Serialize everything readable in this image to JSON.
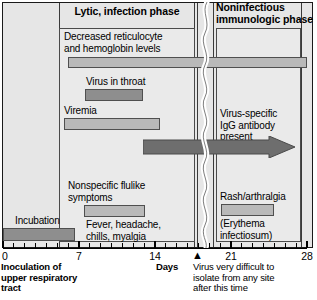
{
  "figure": {
    "axis": {
      "label": "Days",
      "min": 0,
      "max": 28,
      "tick_labels": [
        "0",
        "7",
        "14",
        "21",
        "28"
      ],
      "tick_values": [
        0,
        7,
        14,
        21,
        28
      ],
      "minor_tick_step": 1
    },
    "phases": [
      {
        "id": "lytic",
        "label": "Lytic, infection phase",
        "start_day": 0,
        "end_day": 17
      },
      {
        "id": "immunologic",
        "label": "Noninfectious\nimmunologic phase",
        "line1": "Noninfectious",
        "line2": "immunologic phase",
        "start_day": 18,
        "end_day": 28
      }
    ],
    "events": [
      {
        "id": "decreased-reticulocyte",
        "label_line1": "Decreased reticulocyte",
        "label_line2": "and hemoglobin levels",
        "start_day": 6,
        "end_day": 28,
        "shade": "light"
      },
      {
        "id": "virus-in-throat",
        "label_line1": "Virus in throat",
        "start_day": 7.5,
        "end_day": 13,
        "shade": "dark"
      },
      {
        "id": "viremia",
        "label_line1": "Viremia",
        "start_day": 5.6,
        "end_day": 14.5,
        "shade": "light"
      },
      {
        "id": "igg-antibody",
        "label_line1": "Virus-specific",
        "label_line2": "IgG antibody",
        "label_line3": "present",
        "start_day": 13,
        "end_day": 28,
        "shade": "arrow"
      },
      {
        "id": "nonspecific-flulike",
        "label_line1": "Nonspecific flulike",
        "label_line2": "symptoms",
        "label_line3": "Fever, headache,",
        "label_line4": "chills, myalgia",
        "start_day": 7.4,
        "end_day": 13.2,
        "shade": "light"
      },
      {
        "id": "incubation",
        "label_line1": "Incubation",
        "start_day": 0,
        "end_day": 6.6,
        "shade": "dark"
      },
      {
        "id": "rash-arthralgia",
        "label_line1": "Rash/arthralgia",
        "label_line2": "(Erythema",
        "label_line3": "infectiosum)",
        "start_day": 20,
        "end_day": 25,
        "shade": "light"
      }
    ],
    "captions": {
      "inoculation_line1": "Inoculation of",
      "inoculation_line2": "upper respiratory",
      "inoculation_line3": "tract",
      "days_label": "Days",
      "isolate_line1": "Virus very difficult to",
      "isolate_line2": "isolate from any site",
      "isolate_line3": "after this time",
      "isolate_marker_day": 17
    },
    "colors": {
      "background": "#ffffff",
      "panel_fill": "#e6e6e6",
      "inner_panel_fill": "#eaeaea",
      "bar_light": "#b9b9b9",
      "bar_dark": "#8e8e8e",
      "arrow_fill": "#6e6e6e",
      "stroke": "#4f4f4f",
      "text": "#000000"
    }
  }
}
